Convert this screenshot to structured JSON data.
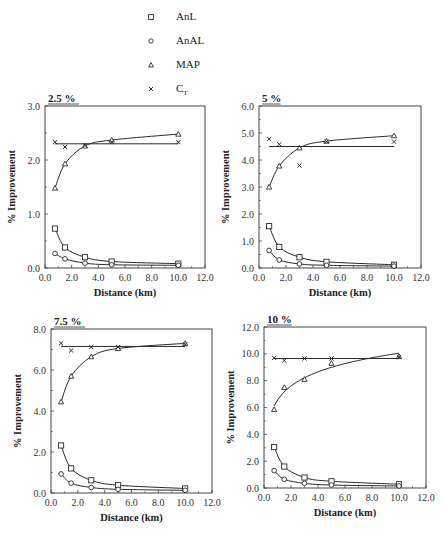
{
  "legend": {
    "items": [
      {
        "marker": "square",
        "label": "AnL",
        "sub": ""
      },
      {
        "marker": "circle",
        "label": "AnAL",
        "sub": ""
      },
      {
        "marker": "triangle",
        "label": "MAP",
        "sub": ""
      },
      {
        "marker": "cross",
        "label": "C",
        "sub": "T"
      }
    ]
  },
  "colors": {
    "ink": "#2a2a2a",
    "frame": "#444444"
  },
  "chart_data": [
    {
      "type": "line",
      "title": "2.5 %",
      "xlabel": "Distance (km)",
      "ylabel": "% Improvement",
      "xlim": [
        0,
        12
      ],
      "ylim": [
        0,
        3
      ],
      "xticks": [
        "0.0",
        "2.0",
        "4.0",
        "6.0",
        "8.0",
        "10.0",
        "12.0"
      ],
      "yticks": [
        "0.0",
        "1.0",
        "2.0",
        "3.0"
      ],
      "frame": {
        "x": 45,
        "y": 106,
        "w": 160,
        "h": 162
      },
      "x": [
        0.75,
        1.5,
        3.0,
        5.0,
        10.0
      ],
      "series": [
        {
          "name": "AnL",
          "marker": "square",
          "values": [
            0.73,
            0.38,
            0.2,
            0.12,
            0.08
          ],
          "fit": "curve"
        },
        {
          "name": "AnAL",
          "marker": "circle",
          "values": [
            0.27,
            0.17,
            0.09,
            0.06,
            0.05
          ],
          "fit": "curve"
        },
        {
          "name": "MAP",
          "marker": "triangle",
          "values": [
            1.48,
            1.93,
            2.26,
            2.37,
            2.48
          ],
          "fit": "curve"
        },
        {
          "name": "CT",
          "marker": "cross",
          "values": [
            2.33,
            2.24,
            2.27,
            2.33,
            2.33
          ],
          "fit": "flat",
          "fit_value": 2.3
        }
      ]
    },
    {
      "type": "line",
      "title": "5 %",
      "xlabel": "Distance (km)",
      "ylabel": "% Improvement",
      "xlim": [
        0,
        12
      ],
      "ylim": [
        0,
        6
      ],
      "xticks": [
        "0.0",
        "2.0",
        "4.0",
        "6.0",
        "8.0",
        "10.0",
        "12.0"
      ],
      "yticks": [
        "0.0",
        "1.0",
        "2.0",
        "3.0",
        "4.0",
        "5.0",
        "6.0"
      ],
      "frame": {
        "x": 259,
        "y": 106,
        "w": 162,
        "h": 162
      },
      "x": [
        0.75,
        1.5,
        3.0,
        5.0,
        10.0
      ],
      "series": [
        {
          "name": "AnL",
          "marker": "square",
          "values": [
            1.55,
            0.78,
            0.4,
            0.23,
            0.12
          ],
          "fit": "curve"
        },
        {
          "name": "AnAL",
          "marker": "circle",
          "values": [
            0.65,
            0.3,
            0.15,
            0.1,
            0.07
          ],
          "fit": "curve"
        },
        {
          "name": "MAP",
          "marker": "triangle",
          "values": [
            3.0,
            3.78,
            4.45,
            4.7,
            4.9
          ],
          "fit": "curve"
        },
        {
          "name": "CT",
          "marker": "cross",
          "values": [
            4.78,
            4.58,
            3.8,
            4.68,
            4.68
          ],
          "fit": "flat",
          "fit_value": 4.5
        }
      ]
    },
    {
      "type": "line",
      "title": "7.5 %",
      "xlabel": "Distance (km)",
      "ylabel": "% Improvement",
      "xlim": [
        0,
        12
      ],
      "ylim": [
        0,
        8
      ],
      "xticks": [
        "0.0",
        "2.0",
        "4.0",
        "6.0",
        "8.0",
        "10.0",
        "12.0"
      ],
      "yticks": [
        "0.0",
        "2.0",
        "4.0",
        "6.0",
        "8.0"
      ],
      "frame": {
        "x": 51,
        "y": 329,
        "w": 161,
        "h": 164
      },
      "x": [
        0.75,
        1.5,
        3.0,
        5.0,
        10.0
      ],
      "series": [
        {
          "name": "AnL",
          "marker": "square",
          "values": [
            2.32,
            1.2,
            0.62,
            0.38,
            0.22
          ],
          "fit": "curve"
        },
        {
          "name": "AnAL",
          "marker": "circle",
          "values": [
            0.93,
            0.48,
            0.27,
            0.18,
            0.13
          ],
          "fit": "curve"
        },
        {
          "name": "MAP",
          "marker": "triangle",
          "values": [
            4.45,
            5.7,
            6.65,
            7.05,
            7.3
          ],
          "fit": "curve"
        },
        {
          "name": "CT",
          "marker": "cross",
          "values": [
            7.3,
            6.95,
            7.12,
            7.12,
            7.25
          ],
          "fit": "flat",
          "fit_value": 7.15
        }
      ]
    },
    {
      "type": "line",
      "title": "10 %",
      "xlabel": "Distance (km)",
      "ylabel": "% Improvement",
      "xlim": [
        0,
        12
      ],
      "ylim": [
        0,
        12
      ],
      "xticks": [
        "0.0",
        "2.0",
        "4.0",
        "6.0",
        "8.0",
        "10.0",
        "12.0"
      ],
      "yticks": [
        "0.0",
        "2.0",
        "4.0",
        "6.0",
        "8.0",
        "10.0",
        "12.0"
      ],
      "frame": {
        "x": 264,
        "y": 327,
        "w": 162,
        "h": 161
      },
      "x": [
        0.75,
        1.5,
        3.0,
        5.0,
        10.0
      ],
      "series": [
        {
          "name": "AnL",
          "marker": "square",
          "values": [
            3.05,
            1.6,
            0.78,
            0.5,
            0.28
          ],
          "fit": "curve"
        },
        {
          "name": "AnAL",
          "marker": "circle",
          "values": [
            1.3,
            0.65,
            0.35,
            0.22,
            0.15
          ],
          "fit": "curve"
        },
        {
          "name": "MAP",
          "marker": "triangle",
          "values": [
            5.85,
            7.5,
            8.1,
            9.3,
            9.8
          ],
          "fit": "log"
        },
        {
          "name": "CT",
          "marker": "cross",
          "values": [
            9.7,
            9.5,
            9.65,
            9.65,
            9.75
          ],
          "fit": "flat",
          "fit_value": 9.65
        }
      ]
    }
  ]
}
